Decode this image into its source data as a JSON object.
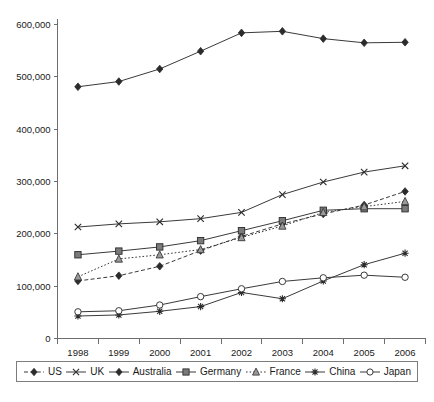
{
  "chart_data": {
    "type": "line",
    "title": "",
    "xlabel": "",
    "ylabel": "",
    "categories": [
      "1998",
      "1999",
      "2000",
      "2001",
      "2002",
      "2003",
      "2004",
      "2005",
      "2006"
    ],
    "ylim": [
      0,
      600000
    ],
    "ytick_values": [
      0,
      100000,
      200000,
      300000,
      400000,
      500000,
      600000
    ],
    "ytick_labels": [
      "0",
      "100,000",
      "200,000",
      "300,000",
      "400,000",
      "500,000",
      "600,000"
    ],
    "grid": false,
    "legend_position": "bottom",
    "series": [
      {
        "name": "US",
        "marker": "diamond-filled",
        "line_style": "dashed",
        "values": [
          110000,
          120000,
          138000,
          168000,
          195000,
          219000,
          238000,
          255000,
          281000
        ]
      },
      {
        "name": "UK",
        "marker": "x-cross",
        "line_style": "solid",
        "values": [
          213000,
          219000,
          223000,
          229000,
          241000,
          275000,
          299000,
          318000,
          330000
        ]
      },
      {
        "name": "Australia",
        "marker": "diamond-filled",
        "line_style": "solid",
        "values": [
          481000,
          491000,
          515000,
          549000,
          584000,
          587000,
          573000,
          565000,
          566000
        ]
      },
      {
        "name": "Germany",
        "marker": "square-filled",
        "line_style": "solid",
        "values": [
          160000,
          167000,
          175000,
          187000,
          206000,
          225000,
          245000,
          248000,
          248000
        ]
      },
      {
        "name": "France",
        "marker": "triangle-up",
        "line_style": "dotted",
        "values": [
          118000,
          152000,
          160000,
          170000,
          193000,
          215000,
          241000,
          252000,
          262000
        ]
      },
      {
        "name": "China",
        "marker": "asterisk",
        "line_style": "solid",
        "values": [
          43000,
          45000,
          52000,
          61000,
          88000,
          76000,
          110000,
          141000,
          163000
        ]
      },
      {
        "name": "Japan",
        "marker": "circle-open",
        "line_style": "solid",
        "values": [
          51000,
          53000,
          64000,
          80000,
          95000,
          109000,
          116000,
          121000,
          117000
        ]
      }
    ]
  },
  "legend": {
    "items": [
      {
        "label": "US"
      },
      {
        "label": "UK"
      },
      {
        "label": "Australia"
      },
      {
        "label": "Germany"
      },
      {
        "label": "France"
      },
      {
        "label": "China"
      },
      {
        "label": "Japan"
      }
    ]
  },
  "caption": {
    "text": ""
  }
}
